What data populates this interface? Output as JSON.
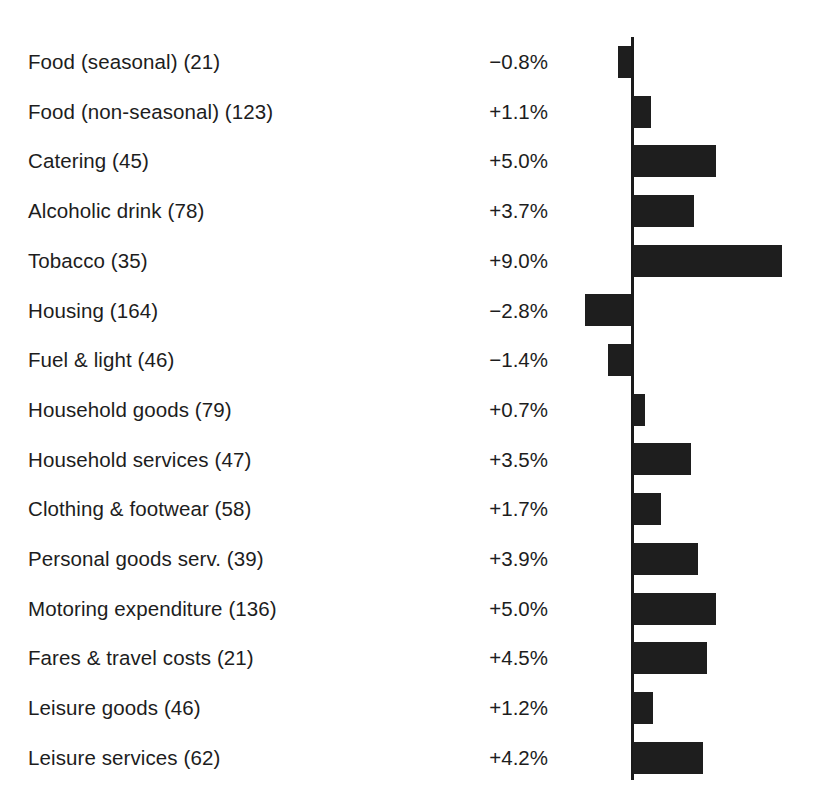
{
  "chart_data": {
    "type": "bar",
    "orientation": "horizontal",
    "title": "",
    "subtitle": "",
    "xlabel": "",
    "ylabel": "",
    "grid": false,
    "legend": null,
    "zero_axis": true,
    "value_suffix": "%",
    "xlim": [
      -3.0,
      9.5
    ],
    "categories": [
      "Food (seasonal) (21)",
      "Food (non-seasonal) (123)",
      "Catering (45)",
      "Alcoholic drink (78)",
      "Tobacco (35)",
      "Housing (164)",
      "Fuel & light (46)",
      "Household goods (79)",
      "Household services (47)",
      "Clothing & footwear (58)",
      "Personal goods serv. (39)",
      "Motoring expenditure (136)",
      "Fares & travel costs (21)",
      "Leisure goods (46)",
      "Leisure services (62)"
    ],
    "category_names": [
      "Food (seasonal)",
      "Food (non-seasonal)",
      "Catering",
      "Alcoholic drink",
      "Tobacco",
      "Housing",
      "Fuel & light",
      "Household goods",
      "Household services",
      "Clothing & footwear",
      "Personal goods serv.",
      "Motoring expenditure",
      "Fares & travel costs",
      "Leisure goods",
      "Leisure services"
    ],
    "weights": [
      21,
      123,
      45,
      78,
      35,
      164,
      46,
      79,
      47,
      58,
      39,
      136,
      21,
      46,
      62
    ],
    "values": [
      -0.8,
      1.1,
      5.0,
      3.7,
      9.0,
      -2.8,
      -1.4,
      0.7,
      3.5,
      1.7,
      3.9,
      5.0,
      4.5,
      1.2,
      4.2
    ],
    "value_labels": [
      "−0.8%",
      "+1.1%",
      "+5.0%",
      "+3.7%",
      "+9.0%",
      "−2.8%",
      "−1.4%",
      "+0.7%",
      "+3.5%",
      "+1.7%",
      "+3.9%",
      "+5.0%",
      "+4.5%",
      "+1.2%",
      "+4.2%"
    ],
    "bar_color": "#1e1e1e",
    "axis_color": "#1a1a1a",
    "background_color": "#ffffff"
  }
}
